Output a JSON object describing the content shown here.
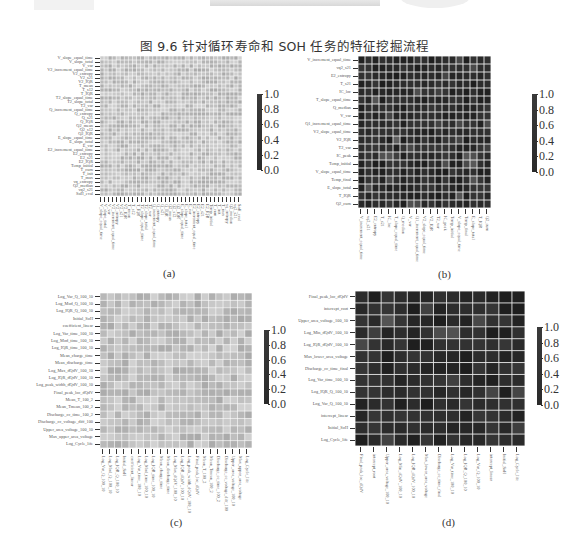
{
  "figure_title": "图 9.6   针对循环寿命和 SOH 任务的特征挖掘流程",
  "colorbar_ticks": [
    "1.0",
    "0.8",
    "0.6",
    "0.4",
    "0.2",
    "0.0"
  ],
  "panels": {
    "a": {
      "caption": "(a)",
      "labels": [
        "V_slope_equal_time",
        "V_slope_total",
        "V_var",
        "V2_increment_equal_time",
        "V2_entropy",
        "V2_s21",
        "V2_IQR",
        "T_mean",
        "T_s12",
        "T_IQR",
        "T2_slope_equal_time",
        "T2_slope_total",
        "T2_var",
        "Q_increment_equal_time",
        "Q_entropy",
        "Q_s21",
        "Q_IQR",
        "Q2_mean",
        "Q2_s12",
        "Q2_IQR",
        "E_slope_equal_time",
        "E_slope_total",
        "E_var",
        "E2_increment_equal_time",
        "E2_entropy",
        "E2_s21",
        "E2_IQR",
        "Temp_initial",
        "T_curn",
        "T_init",
        "T_max",
        "vq_entropy",
        "Q2_median",
        "vq2_s21",
        "SoH_eval"
      ]
    },
    "b": {
      "caption": "(b)",
      "labels": [
        "V_increment_equal_time",
        "vq2_s21",
        "E2_entropy",
        "T_s21",
        "IC_loc",
        "T_slope_equal_time",
        "Q_median",
        "V_var",
        "Q1_increment_equal_time",
        "V2_slope_equal_time",
        "V2_IQR",
        "T2_var",
        "IC_peak",
        "Temp_initial",
        "V_slope_equal_time",
        "Temp_final",
        "E_slope_total",
        "T_IQR",
        "Q2_curn",
        "Q_entropy",
        "SoH_eval"
      ]
    },
    "c": {
      "caption": "(c)",
      "labels": [
        "Log_Var_Q_100_10",
        "Log_Mod_Q_100_10",
        "Log_IQR_Q_100_10",
        "Initial_SoH",
        "coefficient_linear",
        "Log_Var_time_100_10",
        "Log_Mod_time_100_10",
        "Log_IQR_time_100_10",
        "Mean_charge_time",
        "Mean_discharge_time",
        "Log_Max_dQdV_100_10",
        "Log_IQR_dQdV_100_10",
        "Log_peak_width_dQdV_100_10",
        "Final_peak_loc_dQdV",
        "Mean_T_100_2",
        "Mean_Tmean_100_2",
        "Discharge_cc_time_100_2",
        "Discharge_cc_voltage_diff_100",
        "Upper_area_voltage_100_10",
        "Max_upper_area_voltage",
        "Log_Cycle_life"
      ]
    },
    "d": {
      "caption": "(d)",
      "labels": [
        "Final_peak_loc_dQdV",
        "intercept_root",
        "Upper_area_voltage_100_10",
        "Log_Min_dQdV_100_10",
        "Log_IQR_dQdV_100_10",
        "Max_lower_area_voltage",
        "Discharge_cc_time_final",
        "Log_Var_time_100_10",
        "Log_IQR_Q_100_10",
        "Log_Var_Q_100_10",
        "intercept_linear",
        "Initial_SoH",
        "Log_Cycle_life"
      ]
    }
  },
  "chart_data": [
    {
      "type": "heatmap",
      "title": "(a) Feature correlation matrix (initial feature set)",
      "grid_size": 35,
      "appearance": "dense fine grid, mostly light-gray (near-uniform)",
      "colorbar": {
        "range": [
          0.0,
          1.0
        ],
        "ticks": [
          0.0,
          0.2,
          0.4,
          0.6,
          0.8,
          1.0
        ]
      },
      "grid": true
    },
    {
      "type": "heatmap",
      "title": "(b) Feature correlation matrix (selected features, SOH)",
      "grid_size": 19,
      "appearance": "dark cells (low correlation, ~0.0-0.2) with a few lighter cells (~0.3-0.4), white gridlines",
      "colorbar": {
        "range": [
          0.0,
          1.0
        ],
        "ticks": [
          0.0,
          0.2,
          0.4,
          0.6,
          0.8,
          1.0
        ]
      },
      "grid": true
    },
    {
      "type": "heatmap",
      "title": "(c) Feature correlation matrix (initial feature set, cycle life)",
      "grid_size": 21,
      "appearance": "dense fine grid, mostly light-gray",
      "colorbar": {
        "range": [
          0.0,
          1.0
        ],
        "ticks": [
          0.0,
          0.2,
          0.4,
          0.6,
          0.8,
          1.0
        ]
      },
      "grid": true
    },
    {
      "type": "heatmap",
      "title": "(d) Feature correlation matrix (selected features, cycle life)",
      "grid_size": 13,
      "appearance": "dark cells (low correlation) with a few lighter cells, white gridlines",
      "colorbar": {
        "range": [
          0.0,
          1.0
        ],
        "ticks": [
          0.0,
          0.2,
          0.4,
          0.6,
          0.8,
          1.0
        ]
      },
      "grid": true
    }
  ]
}
